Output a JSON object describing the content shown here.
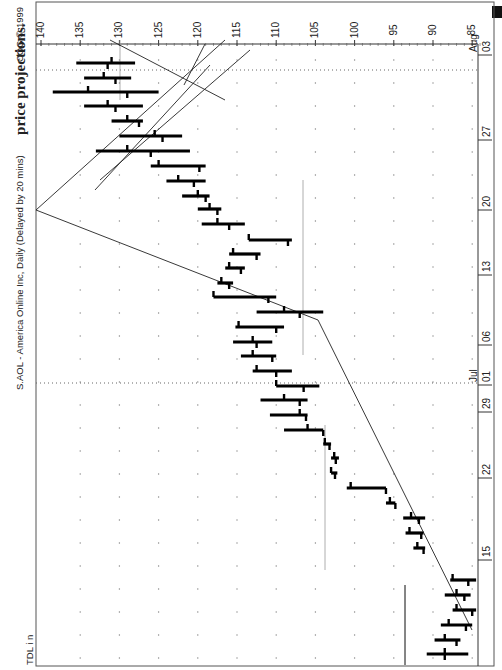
{
  "page": {
    "caption": "price projections.",
    "copyright": "CQG © 1999",
    "chart_title": "S.AOL - America Online Inc, Daily (Delayed by 20 mins)",
    "study_label": "TDL i n"
  },
  "axes": {
    "price_ticks": [
      140,
      135,
      130,
      125,
      120,
      115,
      110,
      105,
      100,
      95,
      90,
      85
    ],
    "date_labels": [
      {
        "label": "15",
        "y": 560
      },
      {
        "label": "22",
        "y": 478
      },
      {
        "label": "29",
        "y": 412
      },
      {
        "label": "01",
        "month": "Jul",
        "y": 385
      },
      {
        "label": "06",
        "y": 345
      },
      {
        "label": "13",
        "y": 275
      },
      {
        "label": "20",
        "y": 210
      },
      {
        "label": "27",
        "y": 140
      },
      {
        "label": "03",
        "month": "Aug",
        "y": 55
      }
    ]
  },
  "chart_data": {
    "type": "ohlc",
    "title": "S.AOL - America Online Inc, Daily (Delayed by 20 mins)",
    "orientation": "rotated 90° counter-clockwise (time runs bottom→top, price decreases left→right)",
    "xlabel": "Date (June–August 1999)",
    "ylabel": "Price",
    "ylim": [
      85,
      140
    ],
    "x_ticks": [
      "Jun 15",
      "Jun 22",
      "Jun 29",
      "Jul 01",
      "Jul 06",
      "Jul 13",
      "Jul 20",
      "Jul 27",
      "Aug 03"
    ],
    "grid": "dotted",
    "bars": [
      {
        "row": 654,
        "high": 90.8,
        "low": 85.5,
        "open": 88.5,
        "close": 88.5
      },
      {
        "row": 640,
        "high": 89.8,
        "low": 86.5,
        "open": 88.5,
        "close": 87.0
      },
      {
        "row": 625,
        "high": 89.0,
        "low": 85.0,
        "open": 88.0,
        "close": 85.8
      },
      {
        "row": 610,
        "high": 87.5,
        "low": 84.5,
        "open": 87.0,
        "close": 85.0
      },
      {
        "row": 595,
        "high": 88.5,
        "low": 85.2,
        "open": 87.0,
        "close": 86.0
      },
      {
        "row": 580,
        "high": 87.8,
        "low": 84.5,
        "open": 87.5,
        "close": 85.5
      },
      {
        "row": 548,
        "high": 92.5,
        "low": 91.0,
        "open": 92.0,
        "close": 91.2
      },
      {
        "row": 533,
        "high": 93.5,
        "low": 91.2,
        "open": 93.0,
        "close": 91.5
      },
      {
        "row": 518,
        "high": 93.8,
        "low": 91.0,
        "open": 92.8,
        "close": 91.8
      },
      {
        "row": 503,
        "high": 96.0,
        "low": 94.8,
        "open": 95.5,
        "close": 94.8
      },
      {
        "row": 488,
        "high": 101.0,
        "low": 96.0,
        "open": 100.5,
        "close": 96.0
      },
      {
        "row": 473,
        "high": 103.0,
        "low": 102.2,
        "open": 103.0,
        "close": 102.5
      },
      {
        "row": 458,
        "high": 103.0,
        "low": 102.0,
        "open": 102.6,
        "close": 102.4
      },
      {
        "row": 444,
        "high": 104.0,
        "low": 103.0,
        "open": 103.8,
        "close": 103.2
      },
      {
        "row": 430,
        "high": 109.0,
        "low": 104.0,
        "open": 106.0,
        "close": 104.0
      },
      {
        "row": 415,
        "high": 110.8,
        "low": 106.0,
        "open": 107.0,
        "close": 106.2
      },
      {
        "row": 400,
        "high": 112.0,
        "low": 106.0,
        "open": 109.0,
        "close": 107.0
      },
      {
        "row": 386,
        "high": 110.0,
        "low": 104.5,
        "open": 110.0,
        "close": 106.5
      },
      {
        "row": 371,
        "high": 113.0,
        "low": 108.0,
        "open": 112.5,
        "close": 110.0
      },
      {
        "row": 356,
        "high": 114.5,
        "low": 110.0,
        "open": 113.0,
        "close": 110.5
      },
      {
        "row": 342,
        "high": 115.5,
        "low": 110.5,
        "open": 113.0,
        "close": 112.5
      },
      {
        "row": 327,
        "high": 115.2,
        "low": 109.0,
        "open": 114.8,
        "close": 110.0
      },
      {
        "row": 312,
        "high": 112.5,
        "low": 104.0,
        "open": 109.0,
        "close": 107.0
      },
      {
        "row": 297,
        "high": 118.0,
        "low": 110.0,
        "open": 118.0,
        "close": 111.0
      },
      {
        "row": 283,
        "high": 117.5,
        "low": 115.5,
        "open": 117.0,
        "close": 116.0
      },
      {
        "row": 268,
        "high": 116.5,
        "low": 114.0,
        "open": 116.0,
        "close": 114.5
      },
      {
        "row": 254,
        "high": 116.0,
        "low": 112.0,
        "open": 115.5,
        "close": 112.5
      },
      {
        "row": 240,
        "high": 113.5,
        "low": 108.0,
        "open": 113.5,
        "close": 108.5
      },
      {
        "row": 224,
        "high": 119.5,
        "low": 114.0,
        "open": 117.5,
        "close": 116.0
      },
      {
        "row": 209,
        "high": 120.0,
        "low": 117.0,
        "open": 118.5,
        "close": 117.5
      },
      {
        "row": 196,
        "high": 122.0,
        "low": 118.5,
        "open": 120.0,
        "close": 119.0
      },
      {
        "row": 181,
        "high": 124.0,
        "low": 119.0,
        "open": 122.5,
        "close": 120.5
      },
      {
        "row": 166,
        "high": 126.0,
        "low": 119.0,
        "open": 125.0,
        "close": 119.8
      },
      {
        "row": 151,
        "high": 133.0,
        "low": 121.0,
        "open": 129.0,
        "close": 126.0
      },
      {
        "row": 136,
        "high": 130.0,
        "low": 122.0,
        "open": 125.5,
        "close": 124.5
      },
      {
        "row": 121,
        "high": 131.0,
        "low": 127.0,
        "open": 129.0,
        "close": 127.5
      },
      {
        "row": 106,
        "high": 134.5,
        "low": 127.0,
        "open": 131.5,
        "close": 130.5
      },
      {
        "row": 92,
        "high": 138.5,
        "low": 125.0,
        "open": 134.0,
        "close": 129.0
      },
      {
        "row": 78,
        "high": 134.5,
        "low": 128.5,
        "open": 132.0,
        "close": 130.5
      },
      {
        "row": 63,
        "high": 135.5,
        "low": 128.0,
        "open": 131.0,
        "close": 131.5
      }
    ],
    "trendlines": [
      {
        "from": {
          "x": 472,
          "y": 630
        },
        "to": {
          "x": 318,
          "y": 320
        }
      },
      {
        "from": {
          "x": 318,
          "y": 320
        },
        "to": {
          "x": 36,
          "y": 210
        }
      },
      {
        "from": {
          "x": 36,
          "y": 210
        },
        "to": {
          "x": 225,
          "y": 40
        }
      },
      {
        "from": {
          "x": 100,
          "y": 180
        },
        "to": {
          "x": 250,
          "y": 50
        }
      },
      {
        "from": {
          "x": 95,
          "y": 190
        },
        "to": {
          "x": 210,
          "y": 65
        }
      },
      {
        "from": {
          "x": 205,
          "y": 44
        },
        "to": {
          "x": 184,
          "y": 85
        }
      },
      {
        "from": {
          "x": 110,
          "y": 40
        },
        "to": {
          "x": 225,
          "y": 100
        }
      },
      {
        "from": {
          "x": 405,
          "y": 585
        },
        "to": {
          "x": 405,
          "y": 665
        }
      }
    ],
    "reference_lines": [
      {
        "orientation": "vertical",
        "x": 120,
        "y1": 40,
        "y2": 100
      },
      {
        "orientation": "vertical",
        "x": 303,
        "y1": 180,
        "y2": 355
      },
      {
        "orientation": "vertical",
        "x": 325,
        "y1": 425,
        "y2": 570
      },
      {
        "orientation": "vertical",
        "x": 405,
        "y1": 585,
        "y2": 665
      }
    ]
  }
}
